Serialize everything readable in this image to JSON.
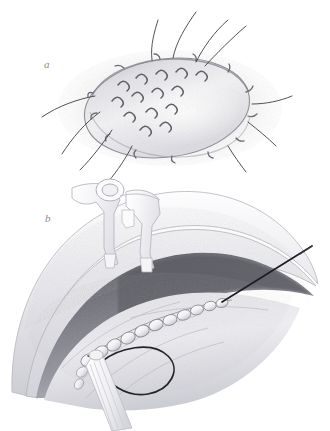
{
  "figure": {
    "type": "medical-illustration",
    "style": "graphite pencil drawing, grayscale",
    "background_color": "#ffffff",
    "width": 330,
    "height": 431,
    "panels": [
      {
        "id": "a",
        "label": "a",
        "label_x": 44,
        "label_y": 68,
        "caption_hidden": true,
        "subject": "oval wound closed with interrupted sutures",
        "bounds": {
          "x": 40,
          "y": 10,
          "w": 270,
          "h": 170
        },
        "elements": {
          "halo_color": "#d9d9dd",
          "oval_fill": "#f2f2f4",
          "oval_edge_color": "#9a9aa0",
          "suture_stitch_color": "#6f6f76",
          "tail_color": "#4a4a50",
          "stitch_count": 14,
          "tail_count": 11
        }
      },
      {
        "id": "b",
        "label": "b",
        "label_x": 45,
        "label_y": 222,
        "caption_hidden": true,
        "subject": "surgical field with self-retaining retractor, running suture, needle and thread loop",
        "bounds": {
          "x": 0,
          "y": 180,
          "w": 330,
          "h": 251
        },
        "elements": {
          "tissue_outer_color": "#e6e6ea",
          "tissue_mid_color": "#c6c6cc",
          "cavity_dark_color": "#6e6e76",
          "retractor_color": "#cfcfd6",
          "retractor_fill": "#fbfbfc",
          "suture_bead_fill": "#f4f4f6",
          "suture_bead_edge": "#9b9ba2",
          "thread_color": "#24242a",
          "needle_color": "#1e1e24",
          "forceps_color": "#dcdce2",
          "bead_count": 11
        }
      }
    ]
  },
  "colors": {
    "ink_dark": "#24242a",
    "ink_mid": "#6f6f76",
    "ink_light": "#b6b6bd",
    "paper": "#ffffff"
  }
}
